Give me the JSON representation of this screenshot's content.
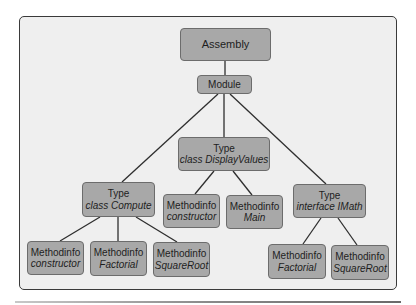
{
  "colors": {
    "background": "#efefef",
    "node_fill": "#a8a8a8",
    "node_border": "#6c6c6c",
    "edge": "#2e2e2e",
    "frame_border": "#3a3a3a"
  },
  "nodes": {
    "assembly": {
      "line1": "Assembly"
    },
    "module": {
      "line1": "Module"
    },
    "type_displayvalues": {
      "line1": "Type",
      "line2": "class DisplayValues"
    },
    "type_compute": {
      "line1": "Type",
      "line2": "class Compute"
    },
    "type_imath": {
      "line1": "Type",
      "line2": "interface IMath"
    },
    "dv_constructor": {
      "line1": "Methodinfo",
      "line2": "constructor"
    },
    "dv_main": {
      "line1": "Methodinfo",
      "line2": "Main"
    },
    "c_constructor": {
      "line1": "Methodinfo",
      "line2": "constructor"
    },
    "c_factorial": {
      "line1": "Methodinfo",
      "line2": "Factorial"
    },
    "c_squareroot": {
      "line1": "Methodinfo",
      "line2": "SquareRoot"
    },
    "m_factorial": {
      "line1": "Methodinfo",
      "line2": "Factorial"
    },
    "m_squareroot": {
      "line1": "Methodinfo",
      "line2": "SquareRoot"
    }
  },
  "edges": [
    [
      "assembly",
      "module"
    ],
    [
      "module",
      "type_compute"
    ],
    [
      "module",
      "type_displayvalues"
    ],
    [
      "module",
      "type_imath"
    ],
    [
      "type_displayvalues",
      "dv_constructor"
    ],
    [
      "type_displayvalues",
      "dv_main"
    ],
    [
      "type_compute",
      "c_constructor"
    ],
    [
      "type_compute",
      "c_factorial"
    ],
    [
      "type_compute",
      "c_squareroot"
    ],
    [
      "type_imath",
      "m_factorial"
    ],
    [
      "type_imath",
      "m_squareroot"
    ]
  ]
}
